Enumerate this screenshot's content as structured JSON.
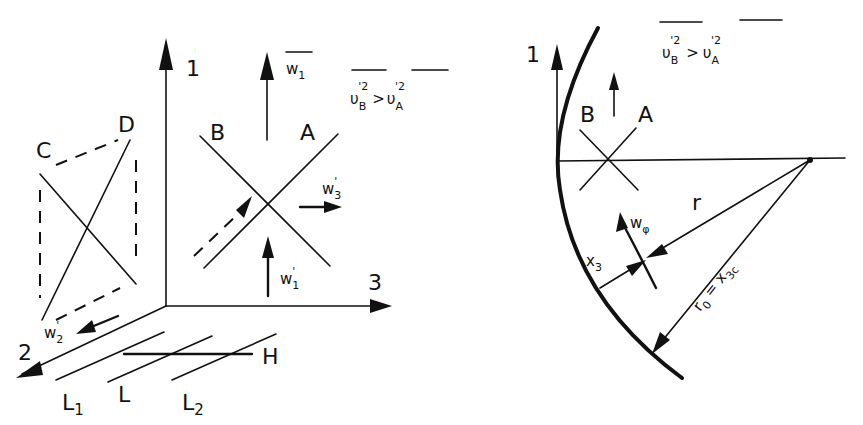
{
  "left_diagram": {
    "axes": {
      "axis_1": "1",
      "axis_2": "2",
      "axis_3": "3"
    },
    "square_labels": {
      "c": "C",
      "d": "D"
    },
    "cross_labels": {
      "b": "B",
      "a": "A"
    },
    "vectors": {
      "w1_bar": "w",
      "w1_bar_sub": "1",
      "w3_prime": "w",
      "w3_prime_sub": "3",
      "w1_prime": "w",
      "w1_prime_sub": "1",
      "w2_prime": "w",
      "w2_prime_sub": "2",
      "prime": "'"
    },
    "inequality": {
      "lhs": "υ",
      "lhs_sub": "B",
      "lhs_sup": "'2",
      "op": ">",
      "rhs": "υ",
      "rhs_sub": "A",
      "rhs_sup": "'2"
    },
    "plane_labels": {
      "l1": "L",
      "l1_sub": "1",
      "l": "L",
      "l2": "L",
      "l2_sub": "2",
      "h": "H"
    }
  },
  "right_diagram": {
    "axis_1": "1",
    "cross_labels": {
      "b": "B",
      "a": "A"
    },
    "inequality": {
      "lhs": "υ",
      "lhs_sub": "B",
      "lhs_sup": "'2",
      "op": ">",
      "rhs": "υ",
      "rhs_sub": "A",
      "rhs_sup": "'2"
    },
    "labels": {
      "r": "r",
      "w_phi": "w",
      "w_phi_sub": "φ",
      "x3": "x",
      "x3_sub": "3",
      "r0_eq": "r",
      "r0_sub": "0",
      "r0_rhs": " = x",
      "r0_rhs_sub": "3c"
    }
  }
}
